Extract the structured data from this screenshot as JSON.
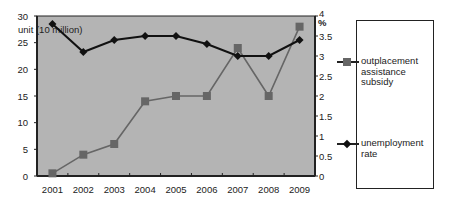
{
  "chart_data": {
    "type": "line",
    "title": "",
    "categories": [
      "2001",
      "2002",
      "2003",
      "2004",
      "2005",
      "2006",
      "2007",
      "2008",
      "2009"
    ],
    "series": [
      {
        "name": "outplacement assistance subsidy",
        "axis": "left",
        "marker": "square",
        "color": "#666666",
        "values": [
          0.5,
          4,
          6,
          14,
          15,
          15,
          24,
          15,
          28
        ]
      },
      {
        "name": "unemployment rate",
        "axis": "right",
        "marker": "diamond",
        "color": "#111111",
        "values": [
          3.8,
          3.1,
          3.4,
          3.5,
          3.5,
          3.3,
          3.0,
          3.0,
          3.4
        ]
      }
    ],
    "ylabel": "unit (10 million)",
    "y2label": "%",
    "ylim": [
      0,
      30
    ],
    "y2lim": [
      0,
      4
    ],
    "yticks": [
      "0",
      "5",
      "10",
      "15",
      "20",
      "25",
      "30"
    ],
    "y2ticks": [
      "0",
      "0.5",
      "1",
      "1.5",
      "2",
      "2.5",
      "3",
      "3.5",
      "4"
    ],
    "plot_background": "#b4b4b4",
    "grid": false,
    "legend_position": "right"
  },
  "legend": {
    "items": [
      {
        "label": "outplacement assistance subsidy"
      },
      {
        "label": "unemployment rate"
      }
    ]
  }
}
